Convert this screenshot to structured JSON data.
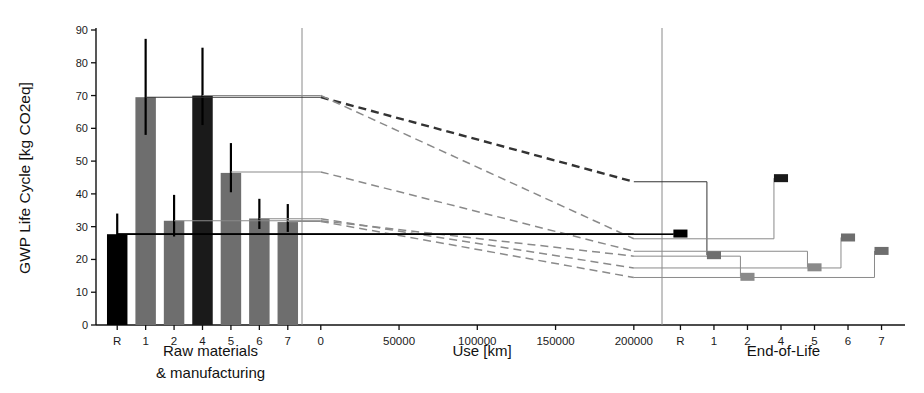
{
  "figure": {
    "width": 924,
    "height": 393,
    "background": "#ffffff",
    "ylabel": "GWP Life Cycle [kg CO2eq]",
    "colors": {
      "reference": "#000000",
      "series_dark": "#1a1a1a",
      "series_gray": "#6e6e6e",
      "axis": "#111111",
      "divider": "#8a8a8a",
      "connector_light": "#9a9a9a",
      "connector_dark": "#333333"
    }
  },
  "chart_data": {
    "type": "bar",
    "title": "",
    "subtitle": "",
    "ylabel": "GWP Life Cycle [kg CO2eq]",
    "ylim": [
      0,
      90
    ],
    "yticks": [
      0,
      10,
      20,
      30,
      40,
      50,
      60,
      70,
      80,
      90
    ],
    "grid": false,
    "legend": null,
    "panels": [
      {
        "id": "raw-materials",
        "xlabel": "Raw materials\n& manufacturing",
        "xlabel_line1": "Raw materials",
        "xlabel_line2": "& manufacturing",
        "type": "bar",
        "categories": [
          "R",
          "1",
          "2",
          "4",
          "5",
          "6",
          "7"
        ],
        "values": [
          27.7,
          69.5,
          31.8,
          70.0,
          46.4,
          32.5,
          31.4
        ],
        "err_low": [
          22.0,
          58.0,
          27.0,
          61.0,
          40.5,
          29.3,
          28.4
        ],
        "err_high": [
          34.0,
          87.3,
          39.7,
          84.6,
          55.5,
          38.5,
          36.9
        ],
        "fills": [
          "#000000",
          "#6e6e6e",
          "#6e6e6e",
          "#1a1a1a",
          "#6e6e6e",
          "#6e6e6e",
          "#6e6e6e"
        ]
      },
      {
        "id": "use",
        "xlabel": "Use [km]",
        "type": "line",
        "xlim": [
          -12000,
          218000
        ],
        "xticks": [
          0,
          50000,
          100000,
          150000,
          200000
        ],
        "xtick_labels": [
          "0",
          "50000",
          "100000",
          "150000",
          "200000"
        ],
        "series": [
          {
            "name": "R",
            "start": 27.7,
            "end": 27.7,
            "break_km": 200000,
            "style": "solid",
            "color": "#000000"
          },
          {
            "name": "1",
            "start": 69.5,
            "end": 43.7,
            "break_km": 200000,
            "style": "dashed",
            "color": "#333333"
          },
          {
            "name": "2",
            "start": 31.8,
            "end": 21.0,
            "break_km": 200000,
            "style": "dashed",
            "color": "#8a8a8a"
          },
          {
            "name": "4",
            "start": 70.0,
            "end": 26.3,
            "break_km": 200000,
            "style": "dashed",
            "color": "#8a8a8a"
          },
          {
            "name": "5",
            "start": 46.7,
            "end": 22.5,
            "break_km": 200000,
            "style": "dashed",
            "color": "#8a8a8a"
          },
          {
            "name": "6",
            "start": 32.4,
            "end": 17.4,
            "break_km": 200000,
            "style": "dashed",
            "color": "#8a8a8a"
          },
          {
            "name": "7",
            "start": 31.6,
            "end": 14.5,
            "break_km": 200000,
            "style": "dashed",
            "color": "#8a8a8a"
          }
        ]
      },
      {
        "id": "end-of-life",
        "xlabel": "End-of-Life",
        "type": "marker",
        "categories": [
          "R",
          "1",
          "2",
          "4",
          "5",
          "6",
          "7"
        ],
        "values": [
          27.9,
          21.3,
          14.7,
          44.8,
          17.6,
          26.7,
          22.6
        ],
        "fills": [
          "#000000",
          "#6e6e6e",
          "#8a8a8a",
          "#1a1a1a",
          "#8a8a8a",
          "#6e6e6e",
          "#6e6e6e"
        ]
      }
    ]
  }
}
